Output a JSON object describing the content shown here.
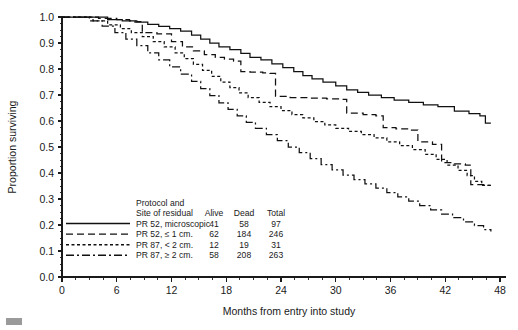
{
  "chart_data": {
    "type": "line",
    "title": "",
    "subtitle": "",
    "xlabel": "Months from entry into study",
    "ylabel": "Proportion surviving",
    "xlim": [
      0,
      48
    ],
    "ylim": [
      0.0,
      1.0
    ],
    "xticks": [
      0,
      6,
      12,
      18,
      24,
      30,
      36,
      42,
      48
    ],
    "xtick_labels": [
      "0",
      "6",
      "12",
      "18",
      "24",
      "30",
      "36",
      "42",
      "48"
    ],
    "xminor_step": 1.5,
    "yticks": [
      0.0,
      0.1,
      0.2,
      0.3,
      0.4,
      0.5,
      0.6,
      0.7,
      0.8,
      0.9,
      1.0
    ],
    "ytick_labels": [
      "0.0",
      "0.1",
      "0.2",
      "0.3",
      "0.4",
      "0.5",
      "0.6",
      "0.7",
      "0.8",
      "0.9",
      "1.0"
    ],
    "yminor_step": 0.025,
    "grid": false,
    "legend_position": "lower-left-inside",
    "curve_style": "step-post",
    "series": [
      {
        "name": "PR 52, microscopic",
        "linestyle": "solid",
        "dasharray": "",
        "color": "#111111",
        "points": [
          [
            0,
            1.0
          ],
          [
            3.2,
            1.0
          ],
          [
            5.0,
            0.99
          ],
          [
            6.6,
            0.985
          ],
          [
            8.0,
            0.98
          ],
          [
            9.4,
            0.972
          ],
          [
            10.6,
            0.964
          ],
          [
            11.8,
            0.955
          ],
          [
            13.0,
            0.946
          ],
          [
            14.2,
            0.93
          ],
          [
            15.2,
            0.915
          ],
          [
            16.2,
            0.9
          ],
          [
            17.2,
            0.885
          ],
          [
            18.4,
            0.875
          ],
          [
            19.6,
            0.86
          ],
          [
            20.6,
            0.845
          ],
          [
            21.8,
            0.835
          ],
          [
            23.0,
            0.82
          ],
          [
            24.2,
            0.805
          ],
          [
            25.4,
            0.79
          ],
          [
            26.4,
            0.775
          ],
          [
            27.4,
            0.762
          ],
          [
            28.6,
            0.75
          ],
          [
            30.0,
            0.735
          ],
          [
            31.2,
            0.72
          ],
          [
            32.4,
            0.71
          ],
          [
            33.6,
            0.7
          ],
          [
            35.0,
            0.69
          ],
          [
            36.4,
            0.68
          ],
          [
            38.0,
            0.672
          ],
          [
            39.6,
            0.662
          ],
          [
            41.2,
            0.655
          ],
          [
            43.0,
            0.638
          ],
          [
            44.6,
            0.628
          ],
          [
            45.8,
            0.62
          ],
          [
            46.4,
            0.592
          ],
          [
            47.0,
            0.592
          ]
        ]
      },
      {
        "name": "PR 52, ≤ 1 cm.",
        "linestyle": "long-dash",
        "dasharray": "7,4",
        "color": "#111111",
        "points": [
          [
            0,
            1.0
          ],
          [
            2.6,
            1.0
          ],
          [
            4.0,
            0.995
          ],
          [
            6.0,
            0.99
          ],
          [
            7.4,
            0.985
          ],
          [
            8.2,
            0.982
          ],
          [
            8.8,
            0.94
          ],
          [
            10.4,
            0.935
          ],
          [
            12.0,
            0.905
          ],
          [
            13.2,
            0.885
          ],
          [
            14.4,
            0.87
          ],
          [
            15.6,
            0.855
          ],
          [
            16.8,
            0.845
          ],
          [
            17.8,
            0.838
          ],
          [
            18.8,
            0.83
          ],
          [
            19.6,
            0.79
          ],
          [
            20.6,
            0.788
          ],
          [
            22.0,
            0.785
          ],
          [
            22.8,
            0.783
          ],
          [
            23.4,
            0.695
          ],
          [
            25.0,
            0.69
          ],
          [
            27.0,
            0.688
          ],
          [
            29.0,
            0.685
          ],
          [
            30.6,
            0.683
          ],
          [
            31.2,
            0.63
          ],
          [
            33.0,
            0.625
          ],
          [
            34.4,
            0.62
          ],
          [
            35.2,
            0.575
          ],
          [
            36.6,
            0.57
          ],
          [
            38.2,
            0.565
          ],
          [
            39.0,
            0.52
          ],
          [
            40.6,
            0.51
          ],
          [
            41.6,
            0.44
          ],
          [
            43.0,
            0.435
          ],
          [
            44.2,
            0.43
          ],
          [
            44.8,
            0.355
          ],
          [
            46.4,
            0.352
          ],
          [
            47.0,
            0.352
          ]
        ]
      },
      {
        "name": "PR 87, < 2 cm.",
        "linestyle": "short-dash",
        "dasharray": "3,2.5",
        "color": "#111111",
        "points": [
          [
            0,
            1.0
          ],
          [
            2.0,
            1.0
          ],
          [
            3.4,
            0.985
          ],
          [
            5.0,
            0.97
          ],
          [
            6.4,
            0.955
          ],
          [
            7.6,
            0.94
          ],
          [
            8.8,
            0.925
          ],
          [
            10.0,
            0.905
          ],
          [
            11.2,
            0.885
          ],
          [
            12.4,
            0.862
          ],
          [
            13.4,
            0.84
          ],
          [
            14.4,
            0.818
          ],
          [
            15.4,
            0.795
          ],
          [
            16.4,
            0.772
          ],
          [
            17.4,
            0.75
          ],
          [
            18.4,
            0.728
          ],
          [
            19.4,
            0.708
          ],
          [
            20.4,
            0.69
          ],
          [
            21.6,
            0.672
          ],
          [
            22.8,
            0.655
          ],
          [
            24.0,
            0.64
          ],
          [
            25.2,
            0.625
          ],
          [
            26.4,
            0.612
          ],
          [
            27.6,
            0.598
          ],
          [
            28.8,
            0.585
          ],
          [
            30.0,
            0.572
          ],
          [
            31.4,
            0.56
          ],
          [
            32.8,
            0.548
          ],
          [
            34.2,
            0.535
          ],
          [
            35.6,
            0.52
          ],
          [
            37.0,
            0.505
          ],
          [
            38.4,
            0.49
          ],
          [
            39.8,
            0.472
          ],
          [
            41.0,
            0.452
          ],
          [
            42.2,
            0.43
          ],
          [
            43.4,
            0.41
          ],
          [
            44.4,
            0.39
          ],
          [
            45.2,
            0.368
          ],
          [
            46.0,
            0.352
          ],
          [
            47.0,
            0.35
          ]
        ]
      },
      {
        "name": "PR 87, ≥ 2 cm.",
        "linestyle": "dash-dot",
        "dasharray": "8,3,2,3",
        "color": "#111111",
        "points": [
          [
            0,
            1.0
          ],
          [
            1.6,
            1.0
          ],
          [
            3.0,
            0.985
          ],
          [
            4.4,
            0.965
          ],
          [
            5.8,
            0.94
          ],
          [
            7.0,
            0.915
          ],
          [
            8.2,
            0.89
          ],
          [
            9.4,
            0.862
          ],
          [
            10.6,
            0.835
          ],
          [
            11.8,
            0.808
          ],
          [
            13.0,
            0.78
          ],
          [
            14.2,
            0.752
          ],
          [
            15.2,
            0.725
          ],
          [
            16.2,
            0.698
          ],
          [
            17.2,
            0.67
          ],
          [
            18.2,
            0.645
          ],
          [
            19.2,
            0.62
          ],
          [
            20.2,
            0.595
          ],
          [
            21.2,
            0.572
          ],
          [
            22.4,
            0.548
          ],
          [
            23.6,
            0.525
          ],
          [
            24.8,
            0.5
          ],
          [
            26.0,
            0.478
          ],
          [
            27.2,
            0.455
          ],
          [
            28.4,
            0.432
          ],
          [
            29.6,
            0.412
          ],
          [
            30.8,
            0.392
          ],
          [
            32.0,
            0.375
          ],
          [
            33.2,
            0.358
          ],
          [
            34.4,
            0.342
          ],
          [
            35.6,
            0.325
          ],
          [
            36.8,
            0.308
          ],
          [
            38.0,
            0.292
          ],
          [
            39.2,
            0.275
          ],
          [
            40.4,
            0.258
          ],
          [
            41.6,
            0.242
          ],
          [
            42.8,
            0.228
          ],
          [
            44.0,
            0.212
          ],
          [
            45.2,
            0.198
          ],
          [
            46.2,
            0.182
          ],
          [
            47.0,
            0.175
          ]
        ]
      }
    ]
  },
  "legend": {
    "title_line1": "Protocol and",
    "title_line2": "Site of residual",
    "columns": [
      "Alive",
      "Dead",
      "Total"
    ],
    "rows": [
      {
        "label": "PR 52, microscopic",
        "alive": "41",
        "dead": "58",
        "total": "97",
        "linestyle": "solid"
      },
      {
        "label": "PR 52, ≤ 1 cm.",
        "alive": "62",
        "dead": "184",
        "total": "246",
        "linestyle": "long-dash"
      },
      {
        "label": "PR 87, < 2 cm.",
        "alive": "12",
        "dead": "19",
        "total": "31",
        "linestyle": "short-dash"
      },
      {
        "label": "PR 87, ≥ 2 cm.",
        "alive": "58",
        "dead": "208",
        "total": "263",
        "linestyle": "dash-dot"
      }
    ]
  },
  "colors": {
    "ink": "#111111",
    "axis": "#1a1a1a",
    "background": "#ffffff"
  }
}
